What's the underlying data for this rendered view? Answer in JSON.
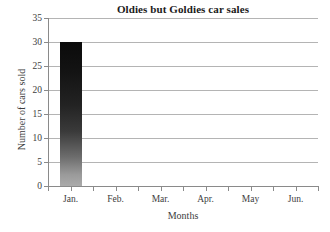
{
  "chart_data": {
    "type": "bar",
    "title": "Oldies but Goldies car sales",
    "xlabel": "Months",
    "ylabel": "Number of cars sold",
    "categories": [
      "Jan.",
      "Feb.",
      "Mar.",
      "Apr.",
      "May",
      "Jun."
    ],
    "values": [
      30,
      0,
      0,
      0,
      0,
      0
    ],
    "ylim": [
      0,
      35
    ],
    "ytick_labels": [
      "0",
      "5",
      "10",
      "15",
      "20",
      "25",
      "30",
      "35"
    ],
    "ytick_values": [
      0,
      5,
      10,
      15,
      20,
      25,
      30,
      35
    ],
    "grid": "horizontal",
    "legend": "none",
    "series": [
      {
        "name": "Cars sold",
        "values": [
          30,
          0,
          0,
          0,
          0,
          0
        ]
      }
    ],
    "bar_style": {
      "fill": "vertical-gradient",
      "top_color": "#0b0b0b",
      "bottom_color": "#ababab"
    },
    "colors": {
      "background": "#ffffff",
      "gridline": "#b4b4b4",
      "axis": "#8a8a8a",
      "text": "#3d3d3d",
      "title": "#1a1a1a"
    }
  }
}
